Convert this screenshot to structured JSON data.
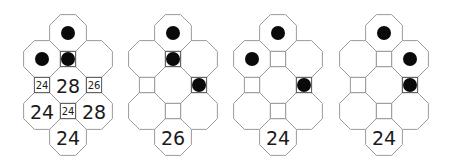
{
  "figure": {
    "colors": {
      "line": "#9a9a9a",
      "dot": "#0a0a0a",
      "text": "#1a1a1a",
      "background": "#ffffff"
    },
    "grid": {
      "cells": [
        {
          "id": "oct-top",
          "type": "octagon",
          "col": 0,
          "row": 0
        },
        {
          "id": "oct-left",
          "type": "octagon",
          "col": -1,
          "row": 1
        },
        {
          "id": "sq-upper",
          "type": "square",
          "col": 0,
          "row": 1
        },
        {
          "id": "oct-right",
          "type": "octagon",
          "col": 1,
          "row": 1
        },
        {
          "id": "sq-left",
          "type": "square",
          "col": -1,
          "row": 2
        },
        {
          "id": "oct-center",
          "type": "octagon",
          "col": 0,
          "row": 2
        },
        {
          "id": "sq-right",
          "type": "square",
          "col": 1,
          "row": 2
        },
        {
          "id": "oct-lower-left",
          "type": "octagon",
          "col": -1,
          "row": 3
        },
        {
          "id": "sq-lower",
          "type": "square",
          "col": 0,
          "row": 3
        },
        {
          "id": "oct-lower-right",
          "type": "octagon",
          "col": 1,
          "row": 3
        },
        {
          "id": "oct-bottom",
          "type": "octagon",
          "col": 0,
          "row": 4
        }
      ]
    },
    "panels": [
      {
        "name": "panel-1",
        "center_x": 68,
        "dots": [
          "oct-top",
          "oct-left",
          "sq-upper"
        ],
        "labels": {
          "sq-left": "24",
          "oct-center": "28",
          "sq-right": "26",
          "oct-lower-left": "24",
          "sq-lower": "24",
          "oct-lower-right": "28",
          "oct-bottom": "24"
        }
      },
      {
        "name": "panel-2",
        "center_x": 173,
        "dots": [
          "oct-top",
          "sq-upper",
          "sq-right"
        ],
        "labels": {
          "oct-bottom": "26"
        }
      },
      {
        "name": "panel-3",
        "center_x": 278,
        "dots": [
          "oct-top",
          "oct-left",
          "sq-right"
        ],
        "labels": {
          "oct-bottom": "24"
        }
      },
      {
        "name": "panel-4",
        "center_x": 384,
        "dots": [
          "oct-top",
          "oct-right",
          "sq-right"
        ],
        "labels": {
          "oct-bottom": "24"
        }
      }
    ]
  }
}
